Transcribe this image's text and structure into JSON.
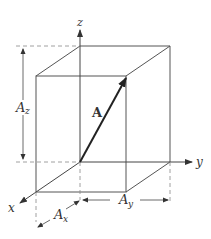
{
  "diagram": {
    "vector_label": "A",
    "axes": {
      "x": "x",
      "y": "y",
      "z": "z"
    },
    "components": {
      "ax": {
        "base": "A",
        "sub": "x"
      },
      "ay": {
        "base": "A",
        "sub": "y"
      },
      "az": {
        "base": "A",
        "sub": "z"
      }
    },
    "colors": {
      "line": "#555555",
      "vector": "#222222",
      "dashed": "#888888"
    }
  }
}
